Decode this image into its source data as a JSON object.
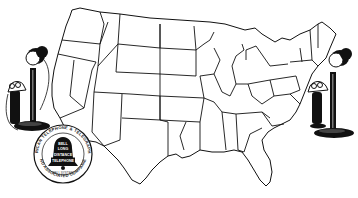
{
  "illustration": {
    "subject": "Map of the United States with candlestick telephones",
    "colors": {
      "ink": "#111111",
      "paper": "#ffffff"
    },
    "emblem": {
      "outer_ring_top": "AMERICAN TELEPHONE & TELEGRAPH CO.",
      "outer_ring_bottom": "AND ASSOCIATED COMPANIES",
      "bell_lines": [
        "BELL",
        "LONG",
        "DISTANCE",
        "TELEPHONE"
      ],
      "small_caption": "BELL SYSTEM"
    },
    "telephones": [
      {
        "position": "left",
        "type": "candlestick-telephone"
      },
      {
        "position": "right",
        "type": "candlestick-telephone"
      }
    ]
  }
}
